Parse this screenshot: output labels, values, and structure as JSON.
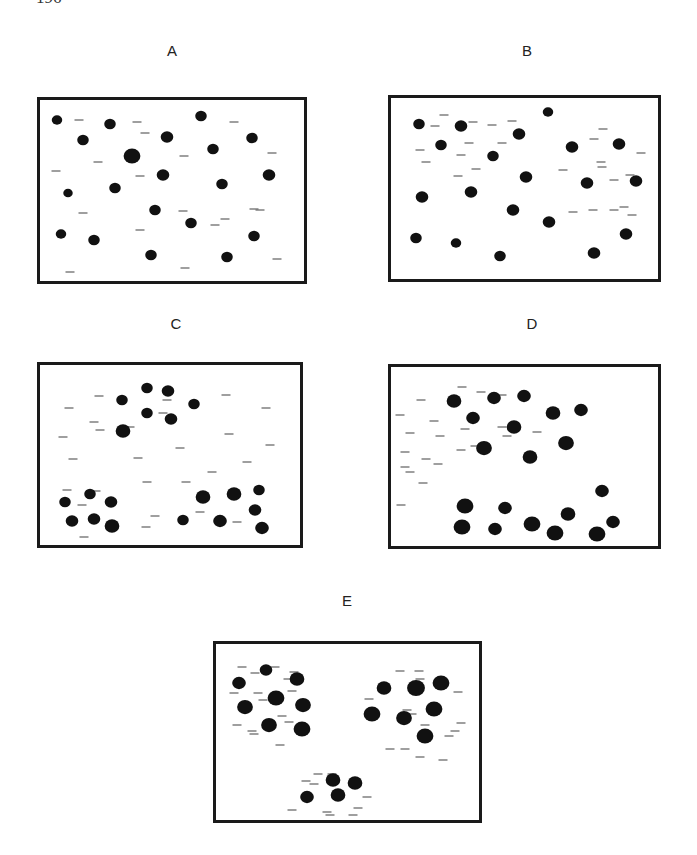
{
  "page": {
    "page_number": "196"
  },
  "figure": {
    "panels": [
      {
        "id": "A",
        "label": "A",
        "description": "Particles uniformly dispersed; dots and dashes randomly mixed",
        "dot_count": 20,
        "dash_count": 19
      },
      {
        "id": "B",
        "label": "B",
        "description": "Dots dispersed; dashes forming loose local groups",
        "dot_count": 20,
        "dash_count": 25
      },
      {
        "id": "C",
        "label": "C",
        "description": "Dots clustered into three groups; dashes dispersed",
        "dot_count": 20,
        "dash_count": 27
      },
      {
        "id": "D",
        "label": "D",
        "description": "Dots in two groups; dashes segregated to the left region",
        "dot_count": 20,
        "dash_count": 21
      },
      {
        "id": "E",
        "label": "E",
        "description": "Dots and dashes co-clustered into three aggregates",
        "dot_count": 19,
        "dash_count": 41
      }
    ]
  },
  "colors": {
    "dot": "#111111",
    "dash": "#6b6b6b",
    "border": "#1a1a1a"
  }
}
